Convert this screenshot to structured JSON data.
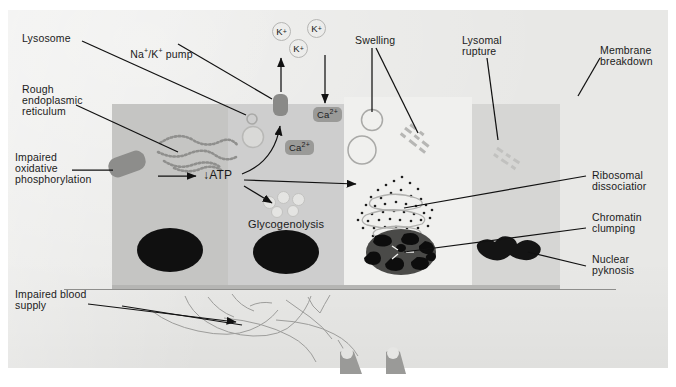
{
  "figure": {
    "background_color": "#e8e8e6",
    "ink_color": "#1b1b1b"
  },
  "labels": {
    "lysosome": "Lysosome",
    "na_k_pump_1": "Na",
    "na_k_pump_2": "/K",
    "na_k_pump_3": "pump",
    "na_k_pump_plain": "Na+/K+ pump",
    "rough_er_l1": "Rough",
    "rough_er_l2": "endoplasmic",
    "rough_er_l3": "reticulum",
    "impaired_ox_l1": "Impaired",
    "impaired_ox_l2": "oxidative",
    "impaired_ox_l3": "phosphorylation",
    "impaired_blood_l1": "Impaired blood",
    "impaired_blood_l2": "supply",
    "atp": "ATP",
    "atp_arrow": "↓",
    "glycogenolysis": "Glycogenolysis",
    "swelling": "Swelling",
    "lysosomal_rupture_l1": "Lysomal",
    "lysosomal_rupture_l2": "rupture",
    "membrane_breakdown_l1": "Membrane",
    "membrane_breakdown_l2": "breakdown",
    "ribosomal_l1": "Ribosomal",
    "ribosomal_l2": "dissociatior",
    "chromatin_l1": "Chromatin",
    "chromatin_l2": "clumping",
    "pyknosis_l1": "Nuclear",
    "pyknosis_l2": "pyknosis"
  },
  "ions": {
    "potassium": [
      {
        "text": "K",
        "charge": "+",
        "x": 277,
        "y": 24
      },
      {
        "text": "K",
        "charge": "+",
        "x": 312,
        "y": 22
      },
      {
        "text": "K",
        "charge": "+",
        "x": 295,
        "y": 42
      }
    ],
    "calcium": [
      {
        "text": "Ca",
        "charge": "2+",
        "x": 343,
        "y": 128
      },
      {
        "text": "Ca",
        "charge": "2+",
        "x": 290,
        "y": 146
      }
    ]
  },
  "organelles": {
    "lysosome_small_ring": {
      "x": 248,
      "y": 116,
      "d": 9
    },
    "lysosome_big_ring": {
      "x": 250,
      "y": 125,
      "d": 19
    },
    "pumps": [
      {
        "name": "na-k-pump-left",
        "x": 279,
        "y": 95
      }
    ],
    "mitochondria": [
      {
        "name": "mitochondrion-normal",
        "x": 125,
        "y": 155,
        "w": 34,
        "h": 20,
        "rot": -20
      }
    ],
    "nuclei": [
      {
        "name": "nucleus-normal",
        "x": 137,
        "y": 228,
        "w": 66,
        "h": 44
      },
      {
        "name": "nucleus-mid",
        "x": 253,
        "y": 230,
        "w": 66,
        "h": 44
      },
      {
        "name": "nucleus-clumped",
        "x": 368,
        "y": 230,
        "w": 66,
        "h": 44
      },
      {
        "name": "nucleus-pyknotic",
        "x": 482,
        "y": 243,
        "w": 64,
        "h": 24
      }
    ],
    "swelling_vacuoles": [
      {
        "x": 362,
        "y": 115,
        "d": 20
      },
      {
        "x": 352,
        "y": 141,
        "d": 26
      }
    ],
    "glycogen_granules": [
      {
        "x": 265,
        "y": 197,
        "d": 10
      },
      {
        "x": 279,
        "y": 193,
        "d": 10
      },
      {
        "x": 294,
        "y": 195,
        "d": 10
      },
      {
        "x": 273,
        "y": 207,
        "d": 9
      },
      {
        "x": 289,
        "y": 206,
        "d": 9
      }
    ]
  },
  "colors": {
    "paper": "#e8e8e6",
    "cell_normal": "#c5c5c3",
    "cell_mid": "#cecece",
    "cell_swollen": "#f0f0ee",
    "cell_late": "#d6d6d4",
    "organelle_grey": "#8d8d8b",
    "nucleus_black": "#101010",
    "vessel_grey": "#9d9d9b"
  }
}
